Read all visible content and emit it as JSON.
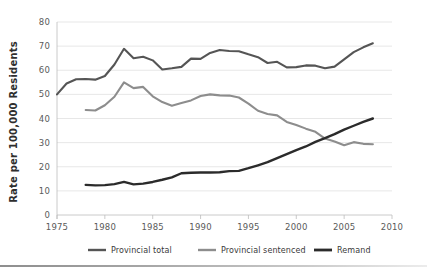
{
  "figure": {
    "name": "incarceration-rate-line-chart",
    "background": "#ffffff"
  },
  "chart_data": {
    "type": "line",
    "title": "",
    "subtitle": "",
    "xlabel": "",
    "ylabel": "Rate per 100,000 Residents",
    "xlim": [
      1975,
      2010
    ],
    "ylim": [
      0,
      80
    ],
    "xticks": [
      1975,
      1980,
      1985,
      1990,
      1995,
      2000,
      2005,
      2010
    ],
    "xtick_labels": [
      "1975",
      "1980",
      "1985",
      "1990",
      "1995",
      "2000",
      "2005",
      "2010"
    ],
    "yticks": [
      0,
      10,
      20,
      30,
      40,
      50,
      60,
      70,
      80
    ],
    "ytick_labels": [
      "0",
      "10",
      "20",
      "30",
      "40",
      "50",
      "60",
      "70",
      "80"
    ],
    "grid": "horizontal",
    "legend_position": "bottom",
    "series": [
      {
        "name": "Provincial total",
        "color": "#555555",
        "width": 2.1,
        "x": [
          1975,
          1976,
          1977,
          1978,
          1979,
          1980,
          1981,
          1982,
          1983,
          1984,
          1985,
          1986,
          1987,
          1988,
          1989,
          1990,
          1991,
          1992,
          1993,
          1994,
          1995,
          1996,
          1997,
          1998,
          1999,
          2000,
          2001,
          2002,
          2003,
          2004,
          2005,
          2006,
          2007,
          2008
        ],
        "values": [
          50.0,
          54.5,
          56.3,
          56.4,
          56.1,
          57.6,
          62.4,
          68.9,
          65.0,
          65.6,
          64.1,
          60.3,
          60.8,
          61.4,
          64.8,
          64.7,
          67.2,
          68.4,
          68.0,
          67.9,
          66.6,
          65.4,
          63.0,
          63.5,
          61.2,
          61.3,
          62.0,
          61.9,
          60.8,
          61.5,
          64.5,
          67.5,
          69.5,
          71.2
        ]
      },
      {
        "name": "Provincial sentenced",
        "color": "#8d8d8d",
        "width": 2.1,
        "x": [
          1978,
          1979,
          1980,
          1981,
          1982,
          1983,
          1984,
          1985,
          1986,
          1987,
          1988,
          1989,
          1990,
          1991,
          1992,
          1993,
          1994,
          1995,
          1996,
          1997,
          1998,
          1999,
          2000,
          2001,
          2002,
          2003,
          2004,
          2005,
          2006,
          2007,
          2008
        ],
        "values": [
          43.5,
          43.3,
          45.5,
          49.0,
          55.0,
          52.6,
          53.1,
          49.2,
          46.8,
          45.3,
          46.4,
          47.5,
          49.3,
          50.0,
          49.6,
          49.5,
          48.7,
          46.2,
          43.2,
          41.9,
          41.3,
          38.6,
          37.3,
          35.8,
          34.5,
          31.7,
          30.5,
          28.9,
          30.2,
          29.5,
          29.3
        ]
      },
      {
        "name": "Remand",
        "color": "#2b2b2b",
        "width": 2.4,
        "x": [
          1978,
          1979,
          1980,
          1981,
          1982,
          1983,
          1984,
          1985,
          1986,
          1987,
          1988,
          1989,
          1990,
          1991,
          1992,
          1993,
          1994,
          1995,
          1996,
          1997,
          1998,
          1999,
          2000,
          2001,
          2002,
          2003,
          2004,
          2005,
          2006,
          2007,
          2008
        ],
        "values": [
          12.5,
          12.3,
          12.4,
          12.8,
          13.7,
          12.7,
          13.0,
          13.7,
          14.6,
          15.6,
          17.3,
          17.5,
          17.6,
          17.6,
          17.7,
          18.2,
          18.3,
          19.4,
          20.6,
          21.9,
          23.6,
          25.2,
          26.9,
          28.4,
          30.3,
          31.9,
          33.5,
          35.4,
          37.0,
          38.6,
          40.0
        ]
      }
    ],
    "annotations": []
  },
  "legend": {
    "items": [
      {
        "label": "Provincial total",
        "color": "#555555"
      },
      {
        "label": "Provincial sentenced",
        "color": "#8d8d8d"
      },
      {
        "label": "Remand",
        "color": "#2b2b2b"
      }
    ]
  }
}
